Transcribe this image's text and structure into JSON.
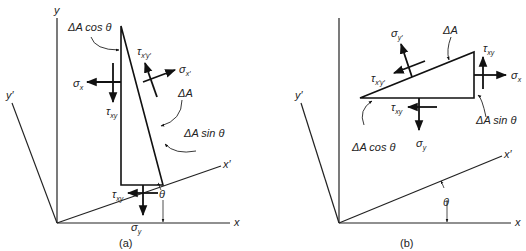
{
  "figure": {
    "panel_a": {
      "caption": "(a)",
      "axes": {
        "x": "x",
        "y": "y",
        "x_prime": "x′",
        "y_prime": "y′",
        "angle": "θ"
      },
      "labels": {
        "dA_cos": "ΔA cos θ",
        "dA_sin": "ΔA sin θ",
        "dA": "ΔA",
        "sigma_x": "σ",
        "sigma_x_sub": "x",
        "tau_xy_left": "τ",
        "tau_xy_left_sub": "xy",
        "tau_xpyp": "τ",
        "tau_xpyp_sub": "x′y′",
        "sigma_xp": "σ",
        "sigma_xp_sub": "x′",
        "tau_xy_bottom": "τ",
        "tau_xy_bottom_sub": "xy",
        "sigma_y": "σ",
        "sigma_y_sub": "y"
      }
    },
    "panel_b": {
      "caption": "(b)",
      "axes": {
        "x": "x",
        "y": "y",
        "x_prime": "x′",
        "y_prime": "y′",
        "angle": "θ"
      },
      "labels": {
        "dA_cos": "ΔA cos θ",
        "dA_sin": "ΔA sin θ",
        "dA": "ΔA",
        "sigma_yp": "σ",
        "sigma_yp_sub": "y′",
        "tau_xpyp": "τ",
        "tau_xpyp_sub": "x′y′",
        "tau_xy_right": "τ",
        "tau_xy_right_sub": "xy",
        "sigma_x": "σ",
        "sigma_x_sub": "x",
        "tau_xy_bottom": "τ",
        "tau_xy_bottom_sub": "xy",
        "sigma_y": "σ",
        "sigma_y_sub": "y"
      }
    }
  }
}
